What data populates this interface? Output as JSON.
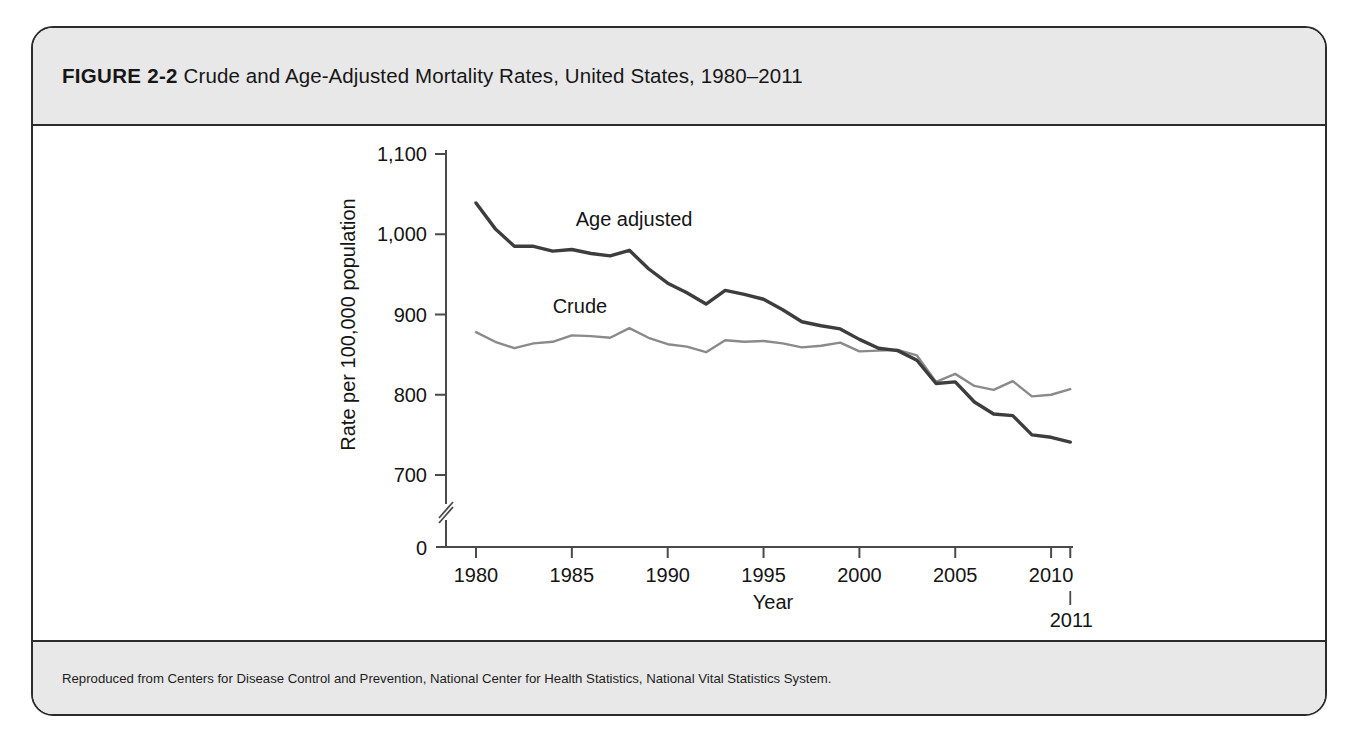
{
  "figure": {
    "number": "FIGURE 2-2",
    "title": "Crude and Age-Adjusted Mortality Rates, United States, 1980–2011",
    "source": "Reproduced from Centers for Disease Control and Prevention, National Center for Health Statistics, National Vital Statistics System."
  },
  "colors": {
    "frame_border": "#2c2c2c",
    "band_background": "#e8e8e8",
    "plot_background": "#ffffff",
    "age_adjusted_line": "#3d3d3d",
    "crude_line": "#8a8a8a",
    "axis": "#4a4a4a",
    "text": "#141414"
  },
  "chart_data": {
    "type": "line",
    "title": "Crude and Age-Adjusted Mortality Rates, United States, 1980–2011",
    "xlabel": "Year",
    "ylabel": "Rate per 100,000 population",
    "xlim": [
      1979,
      2011.6
    ],
    "ylim": [
      700,
      1100
    ],
    "y_axis_break": true,
    "y_zero_label": "0",
    "grid": false,
    "legend_position": "inline-annotation",
    "xticks": [
      1980,
      1985,
      1990,
      1995,
      2000,
      2005,
      2010
    ],
    "xtick_labels": [
      "1980",
      "1985",
      "1990",
      "1995",
      "2000",
      "2005",
      "2010"
    ],
    "extra_xtick": 2011,
    "extra_xtick_label": "2011",
    "yticks": [
      700,
      800,
      900,
      1000,
      1100
    ],
    "ytick_labels": [
      "700",
      "800",
      "900",
      "1,000",
      "1,100"
    ],
    "x": [
      1980,
      1981,
      1982,
      1983,
      1984,
      1985,
      1986,
      1987,
      1988,
      1989,
      1990,
      1991,
      1992,
      1993,
      1994,
      1995,
      1996,
      1997,
      1998,
      1999,
      2000,
      2001,
      2002,
      2003,
      2004,
      2005,
      2006,
      2007,
      2008,
      2009,
      2010,
      2011
    ],
    "series": [
      {
        "name": "Age adjusted",
        "label": "Age adjusted",
        "color": "#3d3d3d",
        "label_x": 1985.2,
        "label_y": 1010,
        "values": [
          1039,
          1007,
          985,
          985,
          979,
          981,
          976,
          973,
          980,
          957,
          939,
          927,
          913,
          930,
          925,
          919,
          906,
          891,
          886,
          882,
          869,
          858,
          855,
          843,
          814,
          816,
          791,
          776,
          774,
          750,
          747,
          741
        ]
      },
      {
        "name": "Crude",
        "label": "Crude",
        "color": "#8a8a8a",
        "label_x": 1984.0,
        "label_y": 902,
        "values": [
          878,
          866,
          858,
          864,
          866,
          874,
          873,
          871,
          883,
          871,
          863,
          860,
          853,
          868,
          866,
          867,
          864,
          859,
          861,
          865,
          854,
          855,
          856,
          849,
          816,
          826,
          811,
          806,
          817,
          798,
          800,
          807
        ]
      }
    ]
  }
}
